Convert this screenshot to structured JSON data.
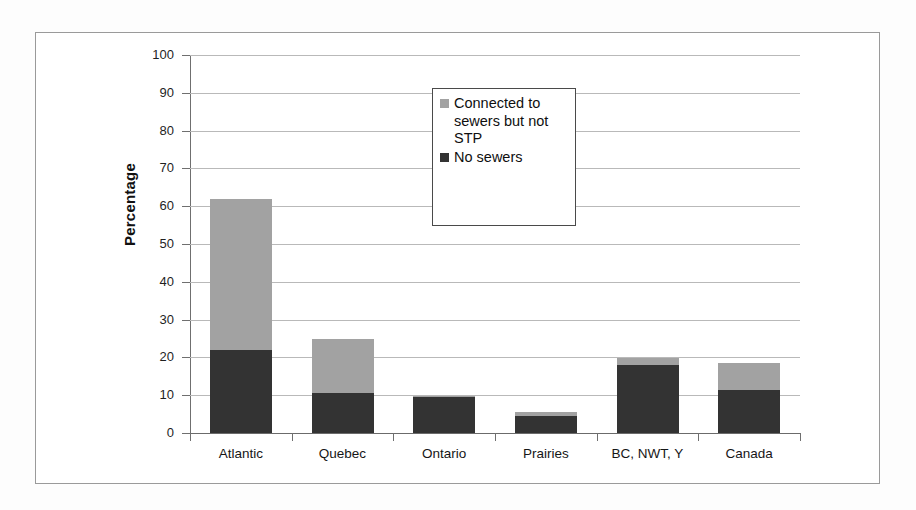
{
  "chart_data": {
    "type": "bar",
    "subtype": "stacked-vertical-bar",
    "title": "",
    "xlabel": "",
    "ylabel": "Percentage",
    "ylim": [
      0,
      100
    ],
    "yticks": [
      0,
      10,
      20,
      30,
      40,
      50,
      60,
      70,
      80,
      90,
      100
    ],
    "ytick_labels": [
      "0",
      "10",
      "20",
      "30",
      "40",
      "50",
      "60",
      "70",
      "80",
      "90",
      "100"
    ],
    "grid": "horizontal",
    "legend_position": "inside-upper-center",
    "categories": [
      "Atlantic",
      "Quebec",
      "Ontario",
      "Prairies",
      "BC, NWT, Y",
      "Canada"
    ],
    "series": [
      {
        "name": "No sewers",
        "color": "#333333",
        "values": [
          22.0,
          10.7,
          9.6,
          4.6,
          18.0,
          11.5
        ]
      },
      {
        "name": "Connected to sewers but not STP",
        "color": "#a2a2a2",
        "values": [
          40.0,
          14.1,
          0.3,
          1.0,
          1.8,
          7.0
        ]
      }
    ],
    "totals": [
      62.0,
      24.8,
      9.9,
      5.6,
      19.8,
      18.5
    ]
  },
  "axis": {
    "y_title": "Percentage"
  },
  "legend": {
    "entries": [
      {
        "label": "Connected to sewers but not STP",
        "color": "#a2a2a2"
      },
      {
        "label": "No sewers",
        "color": "#333333"
      }
    ]
  },
  "colors": {
    "series_light": "#a2a2a2",
    "series_dark": "#333333",
    "gridline": "#b9b9b9",
    "axis": "#6f6f6f",
    "frame": "#9a9a9a",
    "background": "#ffffff"
  }
}
